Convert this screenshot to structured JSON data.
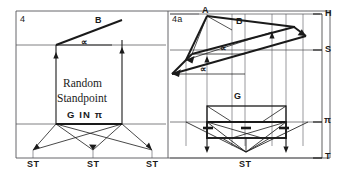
{
  "figure": {
    "type": "technical-perspective-construction-drawing",
    "background_color": "#ffffff",
    "ink_color": "#1a1a1a",
    "thin_line_color": "#55555a",
    "panels": [
      {
        "id": "left",
        "label": "4",
        "caption_line_1": "Random",
        "caption_line_2": "Standpoint",
        "caption_line_3": "G IN π",
        "slope_label": "B",
        "angle_label": "∝",
        "standpoint_labels": [
          "ST",
          "ST",
          "ST"
        ]
      },
      {
        "id": "right",
        "label": "4a",
        "apex_label": "A",
        "slope_label": "B",
        "angle_labels": [
          "∝",
          "∝"
        ],
        "ground_label": "G",
        "standpoint_labels": [
          "ST"
        ],
        "edge_labels": {
          "horizon": "H",
          "station": "S",
          "picture_plane": "π",
          "ground_line": "T"
        }
      }
    ]
  },
  "labels": {
    "panel_left_number": "4",
    "panel_right_number": "4a",
    "left_B": "B",
    "left_alpha": "∝",
    "left_caption_1": "Random",
    "left_caption_2": "Standpoint",
    "left_caption_3": "G IN π",
    "left_st_1": "ST",
    "left_st_2": "ST",
    "left_st_3": "ST",
    "right_A": "A",
    "right_B": "B",
    "right_alpha_1": "∝",
    "right_alpha_2": "∝",
    "right_G": "G",
    "right_st": "ST",
    "edge_H": "H",
    "edge_S": "S",
    "edge_pi": "π",
    "edge_T": "T"
  },
  "colors": {
    "ink": "#1a1a1a",
    "thin": "#55555a",
    "paper": "#ffffff"
  }
}
